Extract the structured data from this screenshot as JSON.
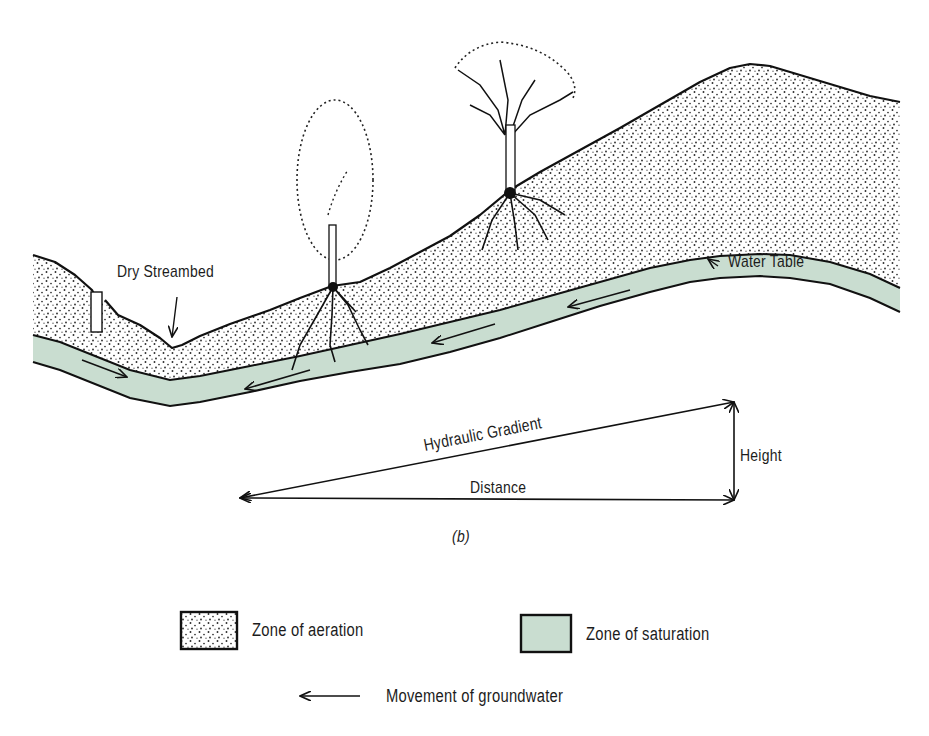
{
  "figure": {
    "panel_label": "(b)",
    "colors": {
      "saturation_fill": "#c9ddd0",
      "aeration_fill": "#ffffff",
      "stipple": "#2a2a2a",
      "outline": "#111111",
      "background": "#ffffff"
    },
    "labels": {
      "dry_streambed": "Dry Streambed",
      "water_table": "Water Table",
      "hydraulic_gradient": "Hydraulic  Gradient",
      "height": "Height",
      "distance": "Distance"
    },
    "legend": {
      "aeration": {
        "label": "Zone of aeration",
        "swatch": "stippled"
      },
      "saturation": {
        "label": "Zone of saturation",
        "swatch": "green"
      },
      "movement": {
        "label": "Movement of groundwater",
        "icon": "left-arrow"
      }
    }
  }
}
